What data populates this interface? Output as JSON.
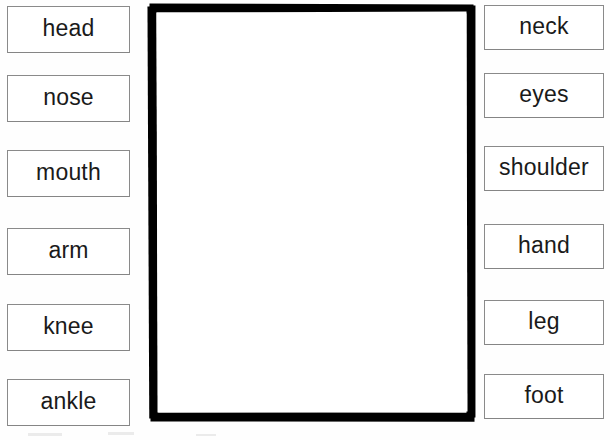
{
  "worksheet": {
    "background_color": "#ffffff",
    "box_border_color": "#8a8a8a",
    "frame_color": "#000000",
    "text_color": "#1a1a1a"
  },
  "left_column": {
    "items": [
      {
        "label": "head"
      },
      {
        "label": "nose"
      },
      {
        "label": "mouth"
      },
      {
        "label": "arm"
      },
      {
        "label": "knee"
      },
      {
        "label": "ankle"
      }
    ]
  },
  "right_column": {
    "items": [
      {
        "label": "neck"
      },
      {
        "label": "eyes"
      },
      {
        "label": "shoulder"
      },
      {
        "label": "hand"
      },
      {
        "label": "leg"
      },
      {
        "label": "foot"
      }
    ]
  },
  "center_panel": {
    "content": ""
  }
}
